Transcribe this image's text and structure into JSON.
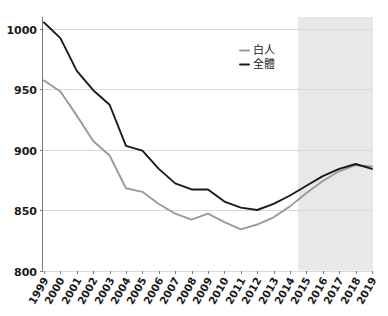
{
  "chart_data": {
    "type": "line",
    "title": "",
    "subtitle": "",
    "xlabel": "",
    "ylabel": "",
    "categories": [
      "1999",
      "2000",
      "2001",
      "2002",
      "2003",
      "2004",
      "2005",
      "2006",
      "2007",
      "2008",
      "2009",
      "2010",
      "2011",
      "2012",
      "2013",
      "2014",
      "2015",
      "2016",
      "2017",
      "2018",
      "2019"
    ],
    "xlim": [
      "1999",
      "2019"
    ],
    "ylim": [
      800,
      1005
    ],
    "yticks": [
      800,
      850,
      900,
      950,
      1000
    ],
    "ytick_labels": [
      "800",
      "850",
      "900",
      "950",
      "1000"
    ],
    "grid": "horizontal",
    "legend_position": "top-right",
    "series": [
      {
        "name": "白人",
        "color": "#9a9a9a",
        "values": [
          957,
          948,
          928,
          907,
          895,
          868,
          865,
          855,
          847,
          842,
          847,
          840,
          834,
          838,
          844,
          853,
          864,
          874,
          882,
          887,
          886
        ]
      },
      {
        "name": "全體",
        "color": "#1a1a1a",
        "values": [
          1005,
          992,
          965,
          949,
          937,
          903,
          899,
          884,
          872,
          867,
          867,
          857,
          852,
          850,
          855,
          862,
          870,
          878,
          884,
          888,
          884
        ]
      }
    ],
    "annotations": [
      {
        "type": "shaded-band",
        "name": "projection-band",
        "x_start": "2015",
        "x_end": "2019",
        "color": "#e8e8e8"
      }
    ]
  },
  "legend": {
    "items": [
      {
        "label": "白人",
        "color": "#9a9a9a",
        "dash": "—"
      },
      {
        "label": "全體",
        "color": "#1a1a1a",
        "dash": "—"
      }
    ]
  },
  "axes": {
    "y": {
      "labels": [
        "1000",
        "950",
        "900",
        "850",
        "800"
      ]
    },
    "x": {
      "labels": [
        "1999",
        "2000",
        "2001",
        "2002",
        "2003",
        "2004",
        "2005",
        "2006",
        "2007",
        "2008",
        "2009",
        "2010",
        "2011",
        "2012",
        "2013",
        "2014",
        "2015",
        "2016",
        "2017",
        "2018",
        "2019"
      ]
    }
  }
}
